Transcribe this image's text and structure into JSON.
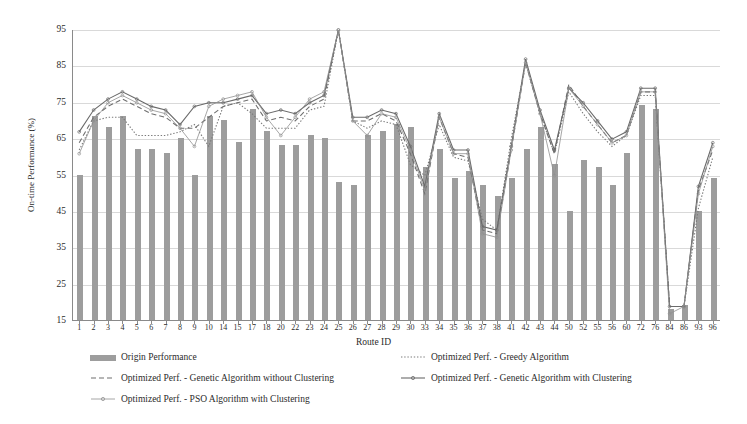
{
  "chart_data": {
    "type": "bar",
    "title": "",
    "xlabel": "Route ID",
    "ylabel": "On-time Performance (%)",
    "ylim": [
      15,
      95
    ],
    "ytick_step": 10,
    "yticks": [
      15,
      25,
      35,
      45,
      55,
      65,
      75,
      85,
      95
    ],
    "grid": true,
    "legend_position": "bottom",
    "categories": [
      "1",
      "2",
      "3",
      "4",
      "5",
      "6",
      "7",
      "8",
      "9",
      "10",
      "14",
      "15",
      "17",
      "18",
      "20",
      "22",
      "23",
      "24",
      "25",
      "26",
      "27",
      "28",
      "29",
      "30",
      "33",
      "34",
      "35",
      "36",
      "37",
      "38",
      "41",
      "42",
      "43",
      "44",
      "50",
      "52",
      "55",
      "56",
      "60",
      "72",
      "76",
      "84",
      "86",
      "93",
      "96"
    ],
    "series": [
      {
        "name": "Origin Performance",
        "kind": "bar",
        "color": "#9d9d9d",
        "values": [
          55,
          71,
          68,
          71,
          62,
          62,
          61,
          65,
          55,
          71,
          70,
          64,
          73,
          67,
          63,
          63,
          66,
          65,
          53,
          52,
          66,
          67,
          69,
          68,
          57,
          62,
          54,
          56,
          52,
          49,
          54,
          62,
          68,
          58,
          45,
          59,
          57,
          52,
          61,
          74,
          73,
          18,
          19,
          45,
          54
        ]
      },
      {
        "name": "Optimized Perf. - Greedy Algorithm",
        "kind": "line",
        "style": "dotted",
        "color": "#7a7a7a",
        "values": [
          62,
          70,
          71,
          71,
          66,
          66,
          66,
          67,
          69,
          63,
          74,
          75,
          72,
          68,
          68,
          68,
          73,
          74,
          95,
          70,
          68,
          70,
          69,
          58,
          55,
          69,
          60,
          59,
          43,
          40,
          65,
          86,
          72,
          61,
          78,
          72,
          67,
          63,
          66,
          77,
          77,
          19,
          19,
          46,
          60
        ]
      },
      {
        "name": "Optimized Perf. - Genetic Algorithm without Clustering",
        "kind": "line",
        "style": "dashed",
        "color": "#6f6f6f",
        "values": [
          64,
          71,
          74,
          76,
          74,
          72,
          71,
          68,
          68,
          71,
          74,
          75,
          76,
          70,
          71,
          70,
          74,
          76,
          95,
          70,
          70,
          72,
          70,
          61,
          50,
          71,
          61,
          60,
          40,
          39,
          62,
          86,
          72,
          61,
          80,
          74,
          69,
          64,
          66,
          78,
          78,
          19,
          19,
          51,
          62
        ]
      },
      {
        "name": "Optimized Perf. - Genetic Algorithm with Clustering",
        "kind": "line",
        "style": "solid-marker",
        "color": "#6a6a6a",
        "values": [
          67,
          73,
          76,
          78,
          76,
          74,
          73,
          69,
          74,
          75,
          75,
          76,
          77,
          72,
          73,
          72,
          75,
          77,
          95,
          71,
          71,
          73,
          72,
          63,
          52,
          72,
          62,
          62,
          41,
          40,
          63,
          87,
          73,
          62,
          79,
          75,
          70,
          65,
          67,
          79,
          79,
          19,
          19,
          52,
          64
        ]
      },
      {
        "name": "Optimized Perf. - PSO Algorithm with Clustering",
        "kind": "line",
        "style": "solid-thin",
        "color": "#909090",
        "values": [
          61,
          70,
          75,
          77,
          75,
          73,
          72,
          68,
          63,
          74,
          76,
          77,
          78,
          71,
          66,
          71,
          76,
          78,
          95,
          70,
          66,
          72,
          71,
          62,
          51,
          71,
          61,
          61,
          39,
          38,
          62,
          86,
          72,
          55,
          79,
          74,
          69,
          64,
          66,
          78,
          78,
          17,
          19,
          50,
          63
        ]
      }
    ]
  },
  "axis": {
    "y_title": "On-time Performance (%)",
    "x_title": "Route ID"
  },
  "legend": {
    "items": [
      {
        "label": "Origin Performance",
        "marker": "bar-swatch"
      },
      {
        "label": "Optimized Perf. - Greedy Algorithm",
        "marker": "dotted-line"
      },
      {
        "label": "Optimized Perf. - Genetic Algorithm without Clustering",
        "marker": "dashed-line"
      },
      {
        "label": "Optimized Perf. - Genetic Algorithm with Clustering",
        "marker": "marker-line"
      },
      {
        "label": "Optimized Perf. - PSO Algorithm with Clustering",
        "marker": "thin-marker-line"
      }
    ]
  },
  "colors": {
    "bar": "#9d9d9d",
    "grid": "#d9d9d9",
    "axis": "#8a8a8a",
    "text": "#2b2b2b"
  }
}
